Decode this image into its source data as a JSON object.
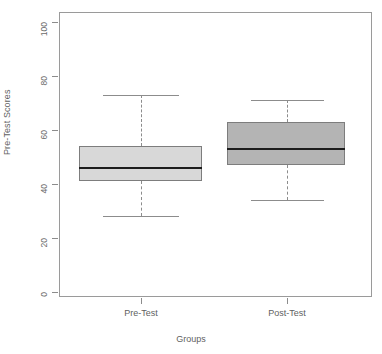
{
  "chart_data": {
    "type": "boxplot",
    "title": "",
    "xlabel": "Groups",
    "ylabel": "Pre-Test Scores",
    "ylim": [
      0,
      100
    ],
    "yticks": [
      0,
      20,
      40,
      60,
      80,
      100
    ],
    "ytick_labels": [
      "0",
      "20",
      "40",
      "60",
      "80",
      "100"
    ],
    "grid": false,
    "legend": "none",
    "categories": [
      "Pre-Test",
      "Post-Test"
    ],
    "boxes": [
      {
        "label": "Pre-Test",
        "lower_whisker": 28,
        "q1": 41,
        "median": 46,
        "q3": 54,
        "upper_whisker": 73,
        "fill": "#d8d8d8",
        "outline": "#7d7d7d",
        "median_color": "#1d1d1d"
      },
      {
        "label": "Post-Test",
        "lower_whisker": 34,
        "q1": 47,
        "median": 53,
        "q3": 63,
        "upper_whisker": 71,
        "fill": "#b4b4b4",
        "outline": "#7d7d7d",
        "median_color": "#1d1d1d"
      }
    ]
  },
  "axes": {
    "y_title": "Pre-Test Scores",
    "x_title": "Groups",
    "y_labels": [
      "100",
      "80",
      "60",
      "40",
      "20",
      "0"
    ],
    "x_labels": [
      "Pre-Test",
      "Post-Test"
    ]
  },
  "header": {
    "title": ""
  },
  "colors": {
    "frame": "#9a9a9a",
    "axis_text": "#5f5f5f",
    "box1_fill": "#d8d8d8",
    "box2_fill": "#b4b4b4",
    "median": "#1d1d1d",
    "whisker": "#8c8c8c",
    "background": "#ffffff"
  }
}
